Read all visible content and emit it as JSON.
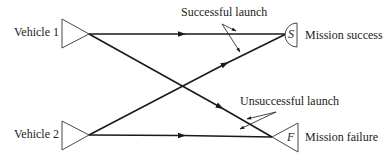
{
  "diagram": {
    "type": "decision-flow",
    "sources": [
      {
        "id": "v1",
        "label": "Vehicle 1",
        "shape": "right-pointing-triangle"
      },
      {
        "id": "v2",
        "label": "Vehicle 2",
        "shape": "right-pointing-triangle"
      }
    ],
    "outcomes": [
      {
        "id": "S",
        "letter": "S",
        "label": "Mission success",
        "shape": "semicircle"
      },
      {
        "id": "F",
        "letter": "F",
        "label": "Mission failure",
        "shape": "left-pointing-triangle"
      }
    ],
    "edges": [
      {
        "from": "v1",
        "to": "S",
        "kind": "successful"
      },
      {
        "from": "v1",
        "to": "F",
        "kind": "unsuccessful"
      },
      {
        "from": "v2",
        "to": "S",
        "kind": "successful"
      },
      {
        "from": "v2",
        "to": "F",
        "kind": "unsuccessful"
      }
    ],
    "annotations": {
      "successful": "Successful launch",
      "unsuccessful": "Unsuccessful launch"
    },
    "colors": {
      "line": "#1a1a1a",
      "background": "#ffffff"
    }
  }
}
